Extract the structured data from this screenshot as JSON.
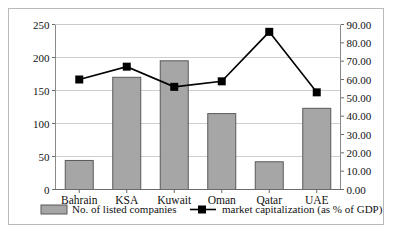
{
  "chart_data": {
    "type": "bar",
    "title": "",
    "subtitle": "",
    "xlabel": "",
    "ylabel": "",
    "y2label": "",
    "categories": [
      "Bahrain",
      "KSA",
      "Kuwait",
      "Oman",
      "Qatar",
      "UAE"
    ],
    "series": [
      {
        "name": "No. of listed companies",
        "type": "bar",
        "axis": "left",
        "values": [
          44,
          170,
          195,
          115,
          42,
          123
        ],
        "color": "#a6a6a6",
        "border_color": "#595959"
      },
      {
        "name": "market capitalization (as % of GDP)",
        "type": "line",
        "axis": "right",
        "values": [
          60.0,
          67.0,
          56.0,
          59.0,
          86.0,
          53.0
        ],
        "color": "#000000",
        "marker": "square"
      }
    ],
    "ylim": [
      0,
      250
    ],
    "yticks": [
      "0",
      "50",
      "100",
      "150",
      "200",
      "250"
    ],
    "y2lim": [
      0,
      90
    ],
    "y2ticks": [
      "0.00",
      "10.00",
      "20.00",
      "30.00",
      "40.00",
      "50.00",
      "60.00",
      "70.00",
      "80.00",
      "90.00"
    ],
    "grid": true,
    "legend_position": "bottom"
  },
  "legend": {
    "bar_label": "No. of listed companies",
    "line_label": "market capitalization (as % of GDP)"
  }
}
